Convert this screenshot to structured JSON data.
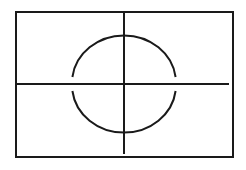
{
  "diagram": {
    "stroke_color": "#1a1a1a",
    "background_color": "#ffffff",
    "frame": {
      "x": 16,
      "y": 12,
      "width": 217,
      "height": 145,
      "stroke_width": 2
    },
    "horizontal_axis": {
      "x1": 17,
      "y1": 84,
      "x2": 229,
      "y2": 84,
      "stroke_width": 2
    },
    "vertical_axis": {
      "x1": 124,
      "y1": 12,
      "x2": 124,
      "y2": 154,
      "stroke_width": 2
    },
    "circle": {
      "cx": 124,
      "cy": 83.5,
      "rx": 52,
      "ry": 47.5,
      "stroke_width": 2,
      "gap_near_horizontal_axis": true,
      "upper_arc": {
        "start": [
          72,
          77
        ],
        "end": [
          176,
          77
        ]
      },
      "lower_arc": {
        "start": [
          72,
          91
        ],
        "end": [
          176,
          91
        ]
      }
    }
  }
}
